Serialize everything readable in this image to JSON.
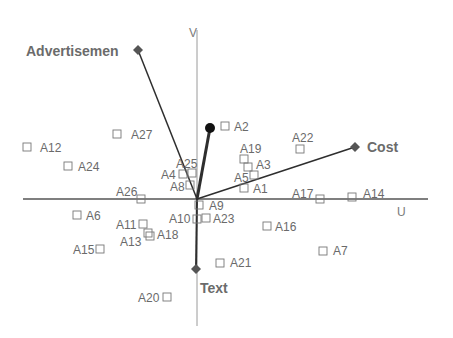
{
  "diagram": {
    "type": "biplot",
    "axes": {
      "horizontal": {
        "label": "U",
        "y": 199,
        "x1": 23,
        "x2": 428,
        "label_x": 397,
        "label_y": 216
      },
      "vertical": {
        "label": "V",
        "x": 197,
        "y1": 30,
        "y2": 326,
        "label_x": 189,
        "label_y": 37
      }
    },
    "origin": {
      "x": 197,
      "y": 199
    },
    "vectors": [
      {
        "name": "Advertisement",
        "label": "Advertisemen",
        "x": 138,
        "y": 50,
        "marker": "diamond",
        "label_x": 26,
        "label_y": 56,
        "label_anchor": "start",
        "width": 1.5
      },
      {
        "name": "Cost",
        "label": "Cost",
        "x": 355,
        "y": 147,
        "marker": "diamond",
        "label_x": 367,
        "label_y": 152,
        "label_anchor": "start",
        "width": 1.5
      },
      {
        "name": "Text",
        "label": "Text",
        "x": 196,
        "y": 269,
        "marker": "diamond",
        "label_x": 200,
        "label_y": 293,
        "label_anchor": "start",
        "width": 2
      },
      {
        "name": "Unlabeled",
        "label": "",
        "x": 210,
        "y": 128,
        "marker": "circle",
        "label_x": 0,
        "label_y": 0,
        "label_anchor": "start",
        "width": 3
      }
    ],
    "points": [
      {
        "id": "A1",
        "bx": 244,
        "by": 188,
        "lx": 253,
        "ly": 193,
        "anchor": "start"
      },
      {
        "id": "A2",
        "bx": 225,
        "by": 126,
        "lx": 234,
        "ly": 131,
        "anchor": "start"
      },
      {
        "id": "A3",
        "bx": 248,
        "by": 167,
        "lx": 256,
        "ly": 169,
        "anchor": "start"
      },
      {
        "id": "A4",
        "bx": 183,
        "by": 174,
        "lx": 161,
        "ly": 179,
        "anchor": "start"
      },
      {
        "id": "A5",
        "bx": 254,
        "by": 175,
        "lx": 234,
        "ly": 182,
        "anchor": "start"
      },
      {
        "id": "A6",
        "bx": 77,
        "by": 215,
        "lx": 86,
        "ly": 220,
        "anchor": "start"
      },
      {
        "id": "A7",
        "bx": 323,
        "by": 251,
        "lx": 333,
        "ly": 255,
        "anchor": "start"
      },
      {
        "id": "A8",
        "bx": 190,
        "by": 185,
        "lx": 170,
        "ly": 191,
        "anchor": "start"
      },
      {
        "id": "A9",
        "bx": 199,
        "by": 205,
        "lx": 209,
        "ly": 210,
        "anchor": "start"
      },
      {
        "id": "A10",
        "bx": 197,
        "by": 219,
        "lx": 169,
        "ly": 223,
        "anchor": "start"
      },
      {
        "id": "A11",
        "bx": 143,
        "by": 224,
        "lx": 116,
        "ly": 229,
        "anchor": "start"
      },
      {
        "id": "A12",
        "bx": 27,
        "by": 147,
        "lx": 40,
        "ly": 152,
        "anchor": "start"
      },
      {
        "id": "A13",
        "bx": 148,
        "by": 233,
        "lx": 120,
        "ly": 246,
        "anchor": "start"
      },
      {
        "id": "A14",
        "bx": 352,
        "by": 197,
        "lx": 363,
        "ly": 198,
        "anchor": "start"
      },
      {
        "id": "A15",
        "bx": 100,
        "by": 249,
        "lx": 73,
        "ly": 254,
        "anchor": "start"
      },
      {
        "id": "A16",
        "bx": 267,
        "by": 226,
        "lx": 275,
        "ly": 231,
        "anchor": "start"
      },
      {
        "id": "A17",
        "bx": 320,
        "by": 199,
        "lx": 292,
        "ly": 198,
        "anchor": "start"
      },
      {
        "id": "A18",
        "bx": 150,
        "by": 236,
        "lx": 157,
        "ly": 239,
        "anchor": "start"
      },
      {
        "id": "A19",
        "bx": 244,
        "by": 159,
        "lx": 240,
        "ly": 153,
        "anchor": "start"
      },
      {
        "id": "A20",
        "bx": 167,
        "by": 297,
        "lx": 138,
        "ly": 302,
        "anchor": "start"
      },
      {
        "id": "A21",
        "bx": 220,
        "by": 263,
        "lx": 230,
        "ly": 267,
        "anchor": "start"
      },
      {
        "id": "A22",
        "bx": 300,
        "by": 149,
        "lx": 292,
        "ly": 142,
        "anchor": "start"
      },
      {
        "id": "A23",
        "bx": 206,
        "by": 218,
        "lx": 213,
        "ly": 223,
        "anchor": "start"
      },
      {
        "id": "A24",
        "bx": 68,
        "by": 166,
        "lx": 78,
        "ly": 171,
        "anchor": "start"
      },
      {
        "id": "A25",
        "bx": 192,
        "by": 173,
        "lx": 176,
        "ly": 168,
        "anchor": "start"
      },
      {
        "id": "A26",
        "bx": 141,
        "by": 199,
        "lx": 116,
        "ly": 196,
        "anchor": "start"
      },
      {
        "id": "A27",
        "bx": 117,
        "by": 134,
        "lx": 131,
        "ly": 139,
        "anchor": "start"
      }
    ],
    "colors": {
      "axis": "#555555",
      "vector": "#2e2e2e",
      "marker": "#555555",
      "point_box": "#777777",
      "label": "#6a6a6a"
    }
  }
}
